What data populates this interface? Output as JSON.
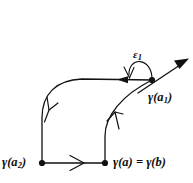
{
  "figure": {
    "background_color": "#ffffff",
    "stroke_color": "#111111",
    "canvas": {
      "width": 193,
      "height": 183
    },
    "labels": {
      "epsilon_1": "ε",
      "epsilon_1_sub": "1",
      "gamma_a1": "γ(a",
      "gamma_a1_sub": "1",
      "gamma_a1_close": ")",
      "gamma_a2": "γ(a",
      "gamma_a2_sub": "2",
      "gamma_a2_close": ")",
      "gamma_a_eq_b": "γ(a) = γ(b)"
    },
    "points": [
      {
        "name": "gamma-a1",
        "x": 152,
        "y": 80,
        "label": "γ(a₁)"
      },
      {
        "name": "gamma-a2",
        "x": 42,
        "y": 163,
        "label": "γ(a₂)"
      },
      {
        "name": "gamma-a-b",
        "x": 105,
        "y": 163,
        "label": "γ(a) = γ(b)"
      }
    ],
    "arrows": [
      {
        "name": "top-segment-arrow",
        "direction": "left",
        "style": "solid-filled",
        "at": [
          124,
          80
        ]
      },
      {
        "name": "left-curve-arrow",
        "direction": "down",
        "style": "open-barb",
        "at": [
          48,
          110
        ]
      },
      {
        "name": "right-curve-arrow",
        "direction": "up",
        "style": "open-barb",
        "at": [
          116,
          118
        ]
      },
      {
        "name": "bottom-segment-arrow",
        "direction": "right",
        "style": "open-chevron",
        "at": [
          78,
          163
        ]
      },
      {
        "name": "tangent-ray-arrow",
        "direction": "up-right",
        "style": "solid-filled",
        "at": [
          184,
          62
        ]
      },
      {
        "name": "epsilon-arc-arrow",
        "direction": "down-left",
        "style": "open-barb",
        "at": [
          130,
          77
        ]
      }
    ]
  }
}
